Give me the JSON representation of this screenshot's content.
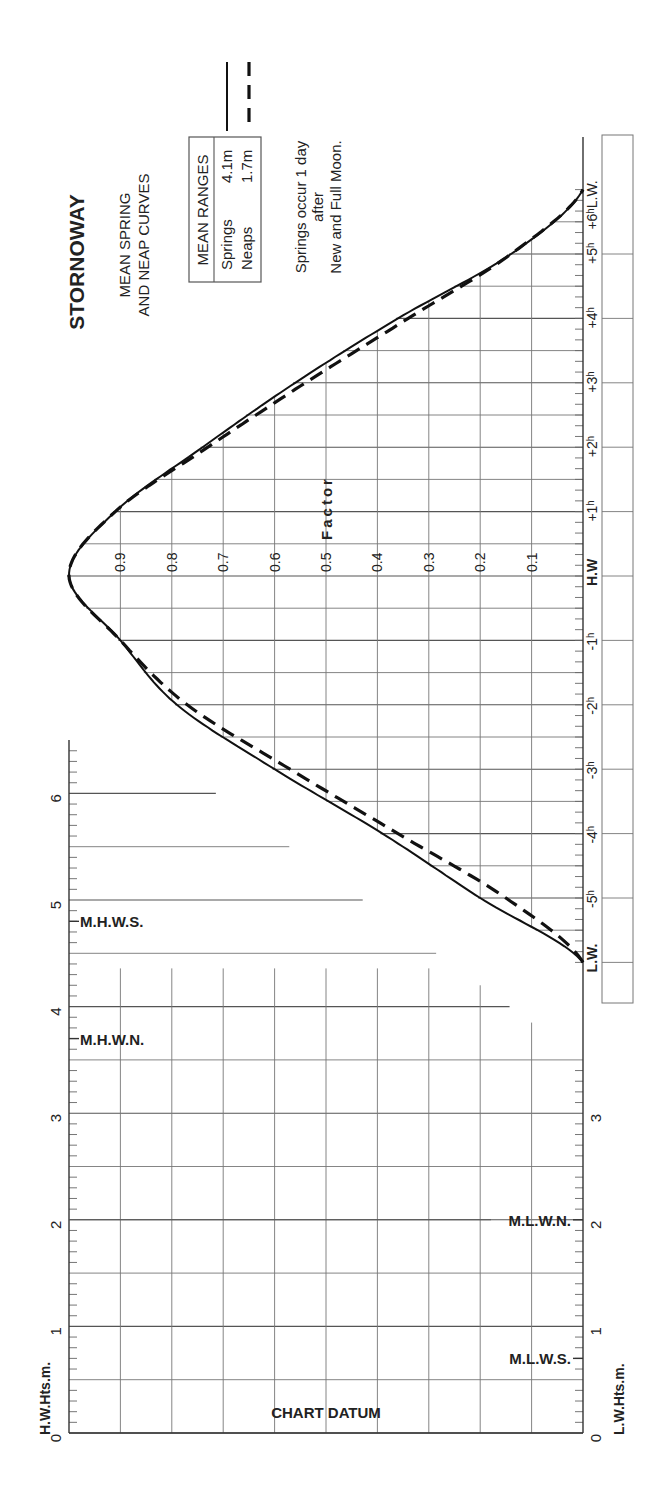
{
  "title": "STORNOWAY",
  "subtitle_lines": [
    "MEAN SPRING",
    "AND NEAP CURVES"
  ],
  "legend": {
    "header": "MEAN RANGES",
    "rows": [
      {
        "label": "Springs",
        "value": "4.1m",
        "style": "solid"
      },
      {
        "label": "Neaps",
        "value": "1.7m",
        "style": "dashed"
      }
    ]
  },
  "note_lines": [
    "Springs occur 1 day",
    "after",
    "New and Full Moon."
  ],
  "factor_label": "Factor",
  "hw_axis": {
    "label": "H.W.Hts.m.",
    "ticks": [
      "0",
      "1",
      "2",
      "3",
      "4",
      "5",
      "6"
    ]
  },
  "lw_axis": {
    "label": "L.W.Hts.m.",
    "ticks": [
      "0",
      "1",
      "2",
      "3"
    ]
  },
  "levels": {
    "mhws": {
      "label": "M.H.W.S.",
      "value": 4.8
    },
    "mhwn": {
      "label": "M.H.W.N.",
      "value": 3.7
    },
    "mlwn": {
      "label": "M.L.W.N.",
      "value": 2.0
    },
    "mlws": {
      "label": "M.L.W.S.",
      "value": 0.7
    }
  },
  "datum_label": "CHART DATUM",
  "time_labels": [
    "L.W.",
    "-5h",
    "-4h",
    "-3h",
    "-2h",
    "-1h",
    "H.W",
    "+1h",
    "+2h",
    "+3h",
    "+4h",
    "+5h",
    "+6h L.W."
  ],
  "chart_data": {
    "type": "line",
    "xlabel": "Time relative to High Water (hours)",
    "ylabel": "Factor",
    "x": [
      -6,
      -5,
      -4,
      -3,
      -2,
      -1,
      0,
      1,
      2,
      3,
      4,
      5,
      6
    ],
    "series": [
      {
        "name": "Springs (4.1m)",
        "style": "solid",
        "values": [
          0.0,
          0.2,
          0.39,
          0.6,
          0.79,
          0.9,
          1.0,
          0.91,
          0.74,
          0.56,
          0.36,
          0.14,
          0.0
        ]
      },
      {
        "name": "Neaps (1.7m)",
        "style": "dashed",
        "values": [
          0.0,
          0.15,
          0.36,
          0.57,
          0.77,
          0.9,
          1.0,
          0.91,
          0.73,
          0.54,
          0.34,
          0.14,
          0.0
        ]
      }
    ],
    "factor_ticks": [
      "0.1",
      "0.2",
      "0.3",
      "0.4",
      "0.5",
      "0.6",
      "0.7",
      "0.8",
      "0.9"
    ],
    "ylim": [
      0,
      1
    ],
    "hw_heights_m": [
      0,
      1,
      2,
      3,
      4,
      5,
      6
    ],
    "lw_heights_m": [
      0,
      1,
      2,
      3
    ],
    "grid": true
  }
}
